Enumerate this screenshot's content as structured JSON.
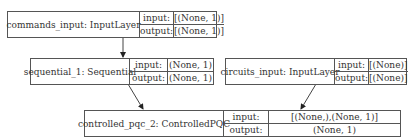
{
  "nodes": [
    {
      "id": "commands_input",
      "label": "commands_input: InputLayer",
      "input_label": "input:",
      "output_label": "output:",
      "input": "[(None, 1)]",
      "output": "[(None, 1)]"
    },
    {
      "id": "sequential_1",
      "label": "sequential_1: Sequential",
      "input_label": "input:",
      "output_label": "output:",
      "input": "(None, 1)",
      "output": "(None, 1)"
    },
    {
      "id": "circuits_input",
      "label": "circuits_input: InputLayer",
      "input_label": "input:",
      "output_label": "output:",
      "input": "[(None)]",
      "output": "[(None)]"
    },
    {
      "id": "controlled_pqc_2",
      "label": "controlled_pqc_2: ControlledPQC",
      "input_label": "input:",
      "output_label": "output:",
      "input": "[(None,),(None, 1)]",
      "output": "(None, 1)"
    }
  ],
  "edges": [
    {
      "from": "commands_input",
      "to": "sequential_1"
    },
    {
      "from": "sequential_1",
      "to": "controlled_pqc_2"
    },
    {
      "from": "circuits_input",
      "to": "controlled_pqc_2"
    }
  ],
  "colors": {
    "stroke": "#555555",
    "text": "#333333",
    "background": "#ffffff"
  }
}
